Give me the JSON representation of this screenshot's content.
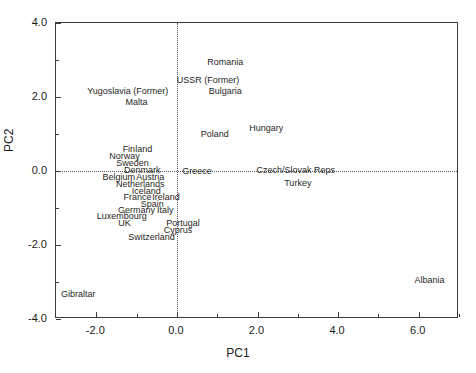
{
  "axes": {
    "xlabel": "PC1",
    "ylabel": "PC2",
    "x_ticklabels": [
      "-2.0",
      "0.0",
      "2.0",
      "4.0",
      "6.0"
    ],
    "y_ticklabels": [
      "4.0",
      "2.0",
      "0.0",
      "-2.0",
      "-4.0"
    ]
  },
  "chart_data": {
    "type": "scatter",
    "title": "",
    "xlabel": "PC1",
    "ylabel": "PC2",
    "xlim": [
      -3.0,
      7.0
    ],
    "ylim": [
      -4.0,
      4.0
    ],
    "xticks": [
      -2.0,
      0.0,
      2.0,
      4.0,
      6.0
    ],
    "yticks": [
      -4.0,
      -2.0,
      0.0,
      2.0,
      4.0
    ],
    "grid": false,
    "reference_lines": {
      "vertical_x": 0.0,
      "horizontal_y": 0.0,
      "style": "dotted"
    },
    "legend": null,
    "marker": "text-label-only",
    "points": [
      {
        "label": "Romania",
        "x": 1.2,
        "y": 2.95
      },
      {
        "label": "USSR (Former)",
        "x": 0.77,
        "y": 2.47
      },
      {
        "label": "Bulgaria",
        "x": 1.2,
        "y": 2.15
      },
      {
        "label": "Yugoslavia (Former)",
        "x": -1.22,
        "y": 2.15
      },
      {
        "label": "Malta",
        "x": -1.0,
        "y": 1.87
      },
      {
        "label": "Hungary",
        "x": 2.22,
        "y": 1.16
      },
      {
        "label": "Poland",
        "x": 0.94,
        "y": 1.0
      },
      {
        "label": "Finland",
        "x": -0.98,
        "y": 0.59
      },
      {
        "label": "Norway",
        "x": -1.3,
        "y": 0.4
      },
      {
        "label": "Sweden",
        "x": -1.1,
        "y": 0.22
      },
      {
        "label": "Denmark",
        "x": -0.86,
        "y": 0.03
      },
      {
        "label": "Belgium",
        "x": -1.44,
        "y": -0.16
      },
      {
        "label": "Austria",
        "x": -0.66,
        "y": -0.16
      },
      {
        "label": "Greece",
        "x": 0.5,
        "y": 0.0
      },
      {
        "label": "Czech/Slovak Reps",
        "x": 2.95,
        "y": 0.03
      },
      {
        "label": "Turkey",
        "x": 3.0,
        "y": -0.32
      },
      {
        "label": "Netherlands",
        "x": -0.91,
        "y": -0.35
      },
      {
        "label": "Iceland",
        "x": -0.76,
        "y": -0.54
      },
      {
        "label": "France",
        "x": -0.98,
        "y": -0.7
      },
      {
        "label": "Ireland",
        "x": -0.27,
        "y": -0.7
      },
      {
        "label": "Spain",
        "x": -0.61,
        "y": -0.89
      },
      {
        "label": "Germany",
        "x": -1.0,
        "y": -1.05
      },
      {
        "label": "Italy",
        "x": -0.29,
        "y": -1.05
      },
      {
        "label": "Luxembourg",
        "x": -1.37,
        "y": -1.21
      },
      {
        "label": "UK",
        "x": -1.3,
        "y": -1.4
      },
      {
        "label": "Portugal",
        "x": 0.15,
        "y": -1.4
      },
      {
        "label": "Cyprus",
        "x": 0.03,
        "y": -1.59
      },
      {
        "label": "Switzerland",
        "x": -0.63,
        "y": -1.78
      },
      {
        "label": "Albania",
        "x": 6.27,
        "y": -2.94
      },
      {
        "label": "Gibraltar",
        "x": -2.9,
        "y": -3.32
      }
    ]
  },
  "style": {
    "frame_color": "#3b3b3b",
    "text_color": "#1f1f24",
    "reference_line_color": "#55555f",
    "background": "#ffffff"
  }
}
